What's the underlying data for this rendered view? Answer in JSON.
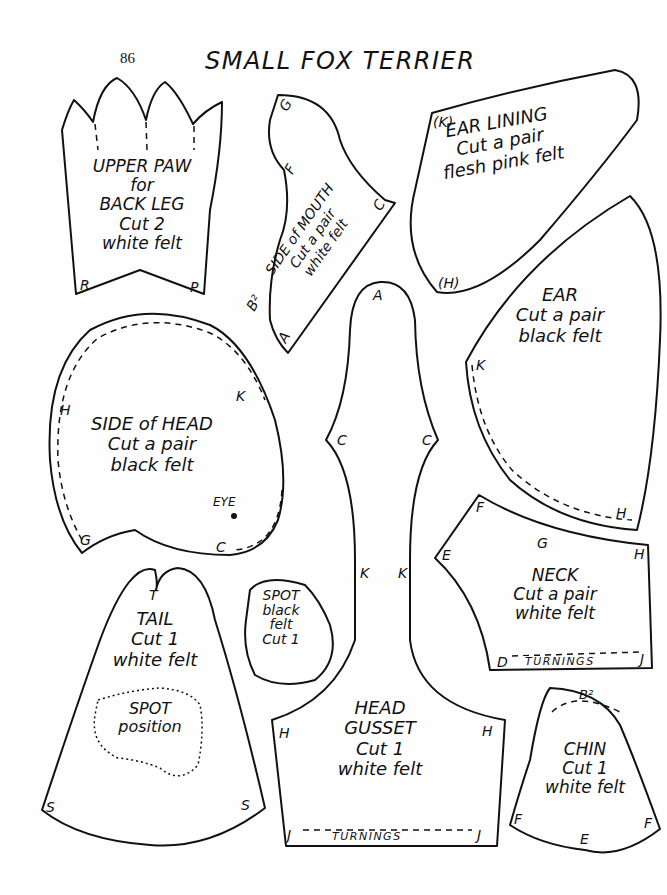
{
  "page": {
    "number": "86",
    "title": "SMALL FOX TERRIER"
  },
  "pieces": {
    "upper_paw": {
      "lines": [
        "UPPER PAW",
        "for",
        "BACK LEG",
        "Cut 2",
        "white felt"
      ],
      "markers": [
        "R",
        "P"
      ]
    },
    "side_of_mouth": {
      "lines": [
        "SIDE of MOUTH",
        "Cut a pair",
        "white felt"
      ],
      "markers": [
        "G",
        "F",
        "C",
        "B²",
        "A"
      ]
    },
    "ear_lining": {
      "lines": [
        "EAR LINING",
        "Cut a pair",
        "flesh pink felt"
      ],
      "markers": [
        "(K)",
        "(H)"
      ]
    },
    "ear": {
      "lines": [
        "EAR",
        "Cut a pair",
        "black felt"
      ],
      "markers": [
        "K",
        "H"
      ]
    },
    "side_of_head": {
      "lines": [
        "SIDE of HEAD",
        "Cut a pair",
        "black felt"
      ],
      "eye_label": "EYE",
      "markers": [
        "H",
        "K",
        "G",
        "C"
      ]
    },
    "head_gusset": {
      "lines": [
        "HEAD",
        "GUSSET",
        "Cut 1",
        "white felt"
      ],
      "markers": [
        "A",
        "C",
        "C",
        "K",
        "K",
        "H",
        "H",
        "J",
        "J"
      ],
      "turnings": "TURNINGS"
    },
    "neck": {
      "lines": [
        "NECK",
        "Cut a pair",
        "white felt"
      ],
      "markers": [
        "F",
        "G",
        "E",
        "H",
        "D",
        "J"
      ],
      "turnings": "TURNINGS"
    },
    "tail": {
      "lines": [
        "TAIL",
        "Cut 1",
        "white felt"
      ],
      "spot_lines": [
        "SPOT",
        "position"
      ],
      "markers": [
        "T",
        "S",
        "S"
      ]
    },
    "spot": {
      "lines": [
        "SPOT",
        "black",
        "felt",
        "Cut 1"
      ]
    },
    "chin": {
      "lines": [
        "CHIN",
        "Cut 1",
        "white felt"
      ],
      "markers": [
        "B²",
        "F",
        "F",
        "E"
      ]
    }
  }
}
